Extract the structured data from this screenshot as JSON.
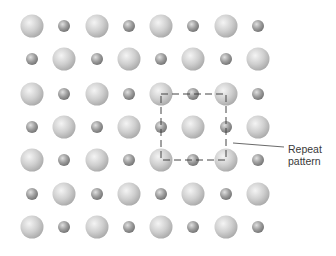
{
  "diagram": {
    "title": "",
    "grid": {
      "rows": 7,
      "cols": 8,
      "x_positions": [
        32,
        64,
        97,
        129,
        161,
        193,
        226,
        258
      ],
      "y_positions": [
        26,
        59,
        94,
        127,
        160,
        194,
        227
      ],
      "large_radius": 11.5,
      "small_radius": 6,
      "pattern": "checkerboard: even row starts with large sphere, odd row starts with small sphere"
    },
    "colors": {
      "large_sphere": "#c8c8c8",
      "small_sphere": "#9a9a9a",
      "dash_line": "#444444",
      "text": "#3a3a3a"
    },
    "repeat_box": {
      "x1": 161,
      "y1": 94,
      "x2": 226,
      "y2": 160
    },
    "leader_line": {
      "x1": 233,
      "y1": 143,
      "x2": 284,
      "y2": 147
    },
    "annotation": {
      "line1": "Repeat",
      "line2": "pattern"
    }
  }
}
